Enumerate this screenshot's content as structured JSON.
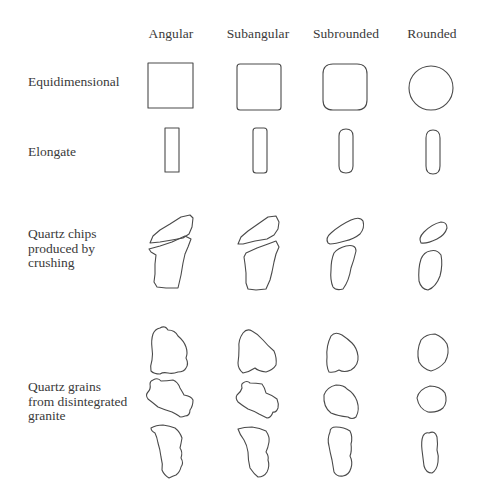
{
  "diagram": {
    "columns": [
      {
        "label": "Angular",
        "x": 171
      },
      {
        "label": "Subangular",
        "x": 258
      },
      {
        "label": "Subrounded",
        "x": 346
      },
      {
        "label": "Rounded",
        "x": 432
      }
    ],
    "rows": [
      {
        "label": "Equidimensional",
        "y": 76
      },
      {
        "label": "Elongate",
        "y": 146
      },
      {
        "label": "Quartz chips\nproduced by\ncrushing",
        "y": 228
      },
      {
        "label": "Quartz grains\nfrom disintegrated\ngranite",
        "y": 381
      }
    ],
    "stroke_color": "#4a4a4a",
    "shapes": [
      {
        "row": "equidimensional",
        "col": "angular",
        "d": "M148,63 L193,63 L193,108 L148,108 Z"
      },
      {
        "row": "equidimensional",
        "col": "subangular",
        "d": "M240,64 L278,64 Q281,64 281,67 L281,107 Q281,110 278,110 L240,110 Q237,110 237,107 L237,67 Q237,64 240,64 Z"
      },
      {
        "row": "equidimensional",
        "col": "subrounded",
        "d": "M333,64 L357,64 Q367,64 367,74 L367,100 Q367,110 357,110 L333,110 Q323,110 323,100 L323,74 Q323,64 333,64 Z"
      },
      {
        "row": "equidimensional",
        "col": "rounded",
        "d": "M453,88 A22,22 0 1 1 409,88 A22,22 0 1 1 453,88 Z"
      },
      {
        "row": "elongate",
        "col": "angular",
        "d": "M165,128 L179,128 L179,172 L165,172 Z"
      },
      {
        "row": "elongate",
        "col": "subangular",
        "d": "M256,128 L264,128 Q267,128 267,131 L267,170 Q267,173 264,173 L256,173 Q253,173 253,170 L253,131 Q253,128 256,128 Z"
      },
      {
        "row": "elongate",
        "col": "subrounded",
        "d": "M346,129 Q353,129 353,136 L353,166 Q353,173 346,173 Q339,173 339,166 L339,136 Q339,129 346,129 Z"
      },
      {
        "row": "elongate",
        "col": "rounded",
        "d": "M433,130 Q440,130 440,138 L440,166 Q440,174 433,174 Q426,174 426,166 L426,138 Q426,130 433,130 Z"
      },
      {
        "row": "chips",
        "col": "angular",
        "d": "M150,243 L153,236 L160,230 L170,224 L181,217 L190,215 L193,218 L192,227 L189,234 L183,238 L172,240 L160,242 Z"
      },
      {
        "row": "chips",
        "col": "angular",
        "d": "M149,249 L160,246 L172,242 L185,236 L191,239 L188,247 L185,254 L183,263 L181,275 L178,288 L166,288 L157,287 L154,282 L155,274 L155,264 L156,255 L151,252 Z"
      },
      {
        "row": "chips",
        "col": "subangular",
        "d": "M238,244 L241,237 L248,231 L258,224 L268,217 L276,216 L279,222 L278,229 L274,235 L267,239 L255,241 L243,244 Z"
      },
      {
        "row": "chips",
        "col": "subangular",
        "d": "M246,253 L257,248 L268,244 L276,241 L279,247 L276,254 L274,262 L272,272 L270,280 L266,289 L256,290 L248,289 L246,283 L246,273 L245,264 L244,257 Z"
      },
      {
        "row": "chips",
        "col": "subrounded",
        "d": "M328,243 Q325,238 331,233 Q340,225 351,220 Q360,216 363,221 Q365,228 360,234 Q354,239 345,241 Q335,244 330,244 Z"
      },
      {
        "row": "chips",
        "col": "subrounded",
        "d": "M334,253 Q338,248 346,246 Q356,244 356,251 Q354,260 351,268 Q349,281 343,289 Q336,291 333,287 Q330,280 331,270 Q331,260 334,253 Z"
      },
      {
        "row": "chips",
        "col": "rounded",
        "d": "M421,243 Q418,238 424,232 Q432,224 441,222 Q447,222 447,228 Q445,235 437,239 Q427,244 421,243 Z"
      },
      {
        "row": "chips",
        "col": "rounded",
        "d": "M430,251 Q437,249 441,255 Q443,265 440,276 Q436,287 428,290 Q421,289 419,281 Q418,268 421,259 Q424,252 430,251 Z"
      },
      {
        "row": "granite",
        "col": "angular",
        "d": "M160,328 Q165,325 168,330 Q175,330 178,336 Q184,341 186,347 Q188,353 186,358 Q189,364 186,368 Q184,372 178,372 Q173,374 168,373 Q163,372 160,374 Q154,374 151,371 Q150,366 152,360 Q153,354 152,348 Q151,340 153,334 Q155,329 160,328 Z"
      },
      {
        "row": "granite",
        "col": "angular",
        "d": "M153,380 Q158,377 161,381 Q167,381 173,380 Q178,382 180,388 Q183,393 184,395 Q191,396 193,400 Q193,406 190,410 Q190,416 185,416 Q180,418 179,416 Q176,414 172,412 Q165,410 158,407 Q152,402 148,399 Q145,395 148,392 Q151,389 150,384 Q150,381 153,380 Z"
      },
      {
        "row": "granite",
        "col": "angular",
        "d": "M151,428 Q156,425 163,425 Q170,426 175,428 Q180,432 182,438 Q181,444 180,448 Q183,452 181,458 Q184,463 181,467 Q180,472 176,475 Q173,476 169,478 Q164,475 162,470 Q163,464 161,457 Q160,449 158,443 Q157,437 155,433 Q151,431 151,428 Z"
      },
      {
        "row": "granite",
        "col": "subangular",
        "d": "M243,333 Q247,328 252,331 Q258,334 263,340 Q268,346 274,351 Q277,358 276,365 Q273,370 266,372 Q258,371 255,368 Q249,372 243,373 Q238,369 238,363 Q239,356 239,348 Q238,340 243,333 Z"
      },
      {
        "row": "granite",
        "col": "subangular",
        "d": "M243,383 Q247,380 250,383 Q256,383 262,384 Q265,388 266,393 Q272,395 277,399 Q279,404 278,408 Q276,413 273,412 Q271,418 267,418 Q263,416 259,414 Q254,411 248,409 Q243,406 238,402 Q235,398 237,395 Q241,392 242,388 Q241,384 243,383 Z"
      },
      {
        "row": "granite",
        "col": "subangular",
        "d": "M238,429 Q244,427 252,427 Q260,428 266,431 Q270,437 269,442 Q268,448 266,452 Q269,456 268,460 Q270,466 267,472 Q264,477 258,477 Q254,474 250,468 Q248,460 248,452 Q247,445 244,440 Q240,435 238,429 Z"
      },
      {
        "row": "granite",
        "col": "subrounded",
        "d": "M331,336 Q335,331 342,335 Q348,339 352,343 Q357,348 358,356 Q359,365 351,370 Q344,373 339,370 Q334,373 329,372 Q326,366 327,357 Q326,346 331,336 Z"
      },
      {
        "row": "granite",
        "col": "subrounded",
        "d": "M324,395 Q327,387 336,385 Q344,385 347,389 Q354,393 357,401 Q360,410 356,417 Q352,420 348,417 Q338,416 331,413 Q323,407 324,395 Z"
      },
      {
        "row": "granite",
        "col": "subrounded",
        "d": "M330,432 Q330,427 336,427 Q344,427 350,431 Q353,437 351,444 Q352,451 350,456 Q353,462 351,468 Q349,475 343,476 Q337,477 334,472 Q333,466 332,460 Q330,452 329,446 Q327,439 330,432 Z"
      },
      {
        "row": "granite",
        "col": "subrounded",
        "d": ""
      },
      {
        "row": "granite",
        "col": "rounded",
        "d": "M421,340 Q426,334 435,334 Q443,337 447,344 Q450,353 445,362 Q439,369 431,371 Q423,369 419,362 Q416,351 421,340 Z"
      },
      {
        "row": "granite",
        "col": "rounded",
        "d": "M417,398 Q419,389 430,386 Q440,386 445,393 Q448,402 443,408 Q437,413 428,412 Q419,409 417,398 Z"
      },
      {
        "row": "granite",
        "col": "rounded",
        "d": "M429,433 Q435,430 437,437 Q438,444 437,450 Q439,456 438,462 Q437,470 432,473 Q426,473 424,466 Q423,458 422,450 Q421,441 423,436 Q425,432 429,433 Z"
      }
    ]
  }
}
